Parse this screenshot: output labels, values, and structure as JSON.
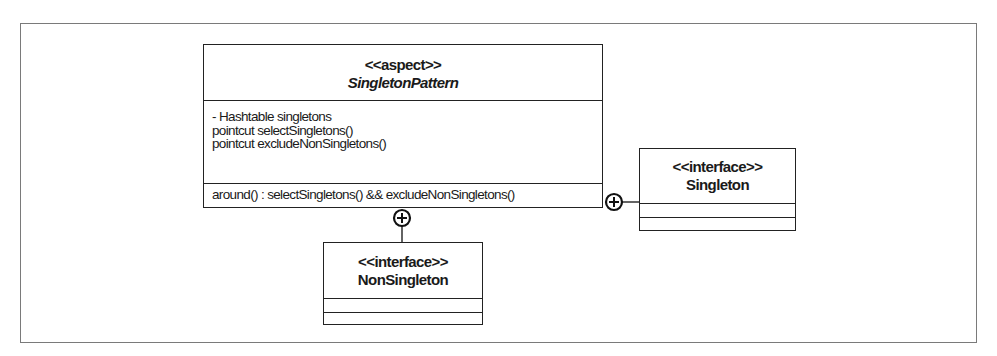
{
  "diagram": {
    "type": "UML class diagram",
    "classes": {
      "aspect": {
        "stereotype": "<<aspect>>",
        "name": "SingletonPattern",
        "name_style": "bold-italic",
        "attributes": [
          "- Hashtable singletons",
          "pointcut selectSingletons()",
          "pointcut excludeNonSingletons()"
        ],
        "operations": [
          "around() : selectSingletons() && excludeNonSingletons()"
        ]
      },
      "singleton": {
        "stereotype": "<<interface>>",
        "name": "Singleton",
        "attributes": [],
        "operations": []
      },
      "nonsingleton": {
        "stereotype": "<<interface>>",
        "name": "NonSingleton",
        "attributes": [],
        "operations": []
      }
    },
    "relationships": [
      {
        "from": "SingletonPattern",
        "to": "Singleton",
        "type": "nesting",
        "icon": "circle-plus-icon"
      },
      {
        "from": "SingletonPattern",
        "to": "NonSingleton",
        "type": "nesting",
        "icon": "circle-plus-icon"
      }
    ],
    "colors": {
      "line": "#222222",
      "frame": "#7a7a7a",
      "background": "#ffffff"
    }
  }
}
